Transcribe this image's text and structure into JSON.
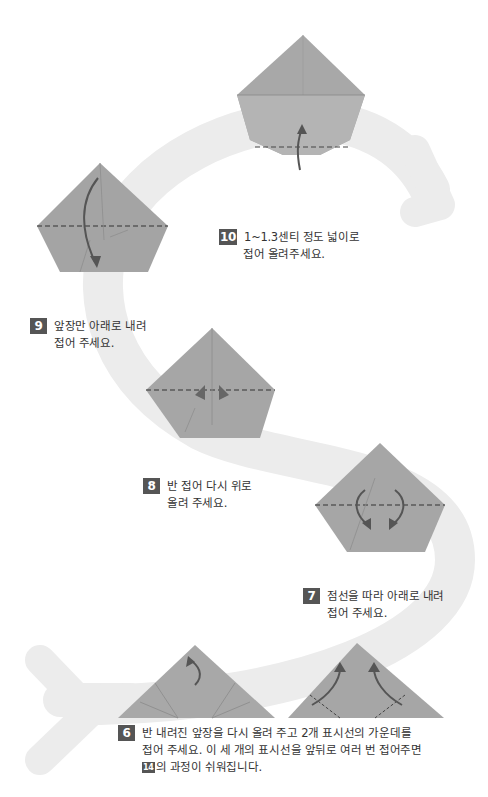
{
  "steps": [
    {
      "number": "10",
      "line1": "1~1.3센티 정도 넓이로",
      "line2": "접어 올려주세요."
    },
    {
      "number": "9",
      "line1": "앞장만 아래로 내려",
      "line2": "접어 주세요."
    },
    {
      "number": "8",
      "line1": "반 접어 다시 위로",
      "line2": "올려 주세요."
    },
    {
      "number": "7",
      "line1": "점선을 따라 아래로 내려",
      "line2": "접어 주세요."
    },
    {
      "number": "6",
      "line1": "반 내려진 앞장을 다시 올려 주고 2개 표시선의 가운데를",
      "line2": "접어 주세요. 이 세 개의 표시선을 앞뒤로 여러 번 접어주면",
      "line3_ref": "14",
      "line3": "의 과정이 쉬워집니다."
    }
  ],
  "colors": {
    "paper": "#a6a6a6",
    "paper_dark": "#8c8c8c",
    "path": "#ebebeb",
    "badge": "#555555",
    "arrow": "#555555"
  }
}
